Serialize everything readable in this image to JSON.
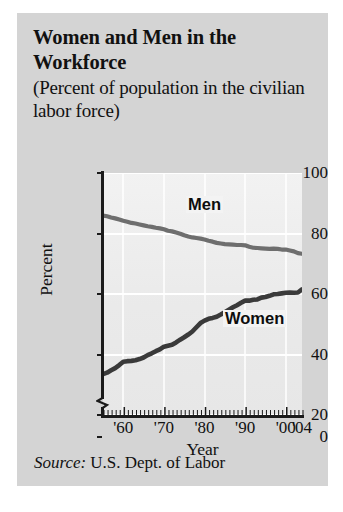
{
  "figure": {
    "title": "Women and Men in the Workforce",
    "subtitle": "(Percent of population in the civilian labor force)",
    "source_key": "Source:",
    "source_value": "U.S. Dept. of Labor"
  },
  "chart_data": {
    "type": "line",
    "title": "Women and Men in the Workforce",
    "subtitle": "(Percent of population in the civilian labor force)",
    "xlabel": "Year",
    "ylabel": "Percent",
    "xlim": [
      1955,
      2004
    ],
    "ylim": [
      20,
      100
    ],
    "y_axis_break": true,
    "y_axis_break_note": "zigzag break between 0 and 20",
    "ytick_labels": [
      "0",
      "20",
      "40",
      "60",
      "80",
      "100"
    ],
    "ytick_values": [
      0,
      20,
      40,
      60,
      80,
      100
    ],
    "xtick_labels": [
      "'60",
      "'70",
      "'80",
      "'90",
      "'00",
      "'04"
    ],
    "xtick_values": [
      1960,
      1970,
      1980,
      1990,
      2000,
      2004
    ],
    "grid": "horizontal-and-vertical-white",
    "legend": "inline-labels",
    "colors": {
      "men_line": "#6e6e6e",
      "women_line": "#3a3a3a",
      "plot_background": "#eeeeee",
      "card_background": "#d4d4d4",
      "gridline": "#ffffff",
      "axis": "#1b1b1b",
      "text": "#111111"
    },
    "x": [
      1955,
      1956,
      1957,
      1958,
      1959,
      1960,
      1961,
      1962,
      1963,
      1964,
      1965,
      1966,
      1967,
      1968,
      1969,
      1970,
      1971,
      1972,
      1973,
      1974,
      1975,
      1976,
      1977,
      1978,
      1979,
      1980,
      1981,
      1982,
      1983,
      1984,
      1985,
      1986,
      1987,
      1988,
      1989,
      1990,
      1991,
      1992,
      1993,
      1994,
      1995,
      1996,
      1997,
      1998,
      1999,
      2000,
      2001,
      2002,
      2003,
      2004
    ],
    "series": [
      {
        "name": "Men",
        "label": "Men",
        "color": "#6e6e6e",
        "values": [
          85.9,
          85.7,
          85.3,
          85.0,
          84.6,
          84.2,
          83.9,
          83.5,
          83.3,
          83.0,
          82.7,
          82.4,
          82.2,
          81.9,
          81.7,
          81.4,
          80.9,
          80.7,
          80.3,
          79.9,
          79.4,
          79.0,
          78.7,
          78.5,
          78.3,
          78.0,
          77.6,
          77.3,
          76.9,
          76.7,
          76.5,
          76.4,
          76.3,
          76.2,
          76.2,
          76.1,
          75.6,
          75.3,
          75.2,
          75.1,
          75.0,
          74.9,
          75.0,
          74.9,
          74.7,
          74.7,
          74.4,
          74.1,
          73.5,
          73.3
        ]
      },
      {
        "name": "Women",
        "label": "Women",
        "color": "#3a3a3a",
        "values": [
          33.5,
          34.0,
          34.8,
          35.5,
          36.5,
          37.6,
          37.8,
          37.9,
          38.1,
          38.5,
          39.0,
          39.8,
          40.4,
          41.1,
          41.7,
          42.6,
          42.9,
          43.2,
          44.0,
          44.9,
          45.7,
          46.6,
          47.6,
          49.0,
          50.4,
          51.2,
          51.8,
          52.1,
          52.5,
          53.2,
          54.0,
          54.8,
          55.6,
          56.3,
          57.1,
          57.8,
          57.8,
          58.1,
          58.2,
          58.8,
          59.0,
          59.4,
          59.9,
          60.0,
          60.2,
          60.4,
          60.5,
          60.4,
          60.5,
          61.5
        ]
      }
    ]
  }
}
